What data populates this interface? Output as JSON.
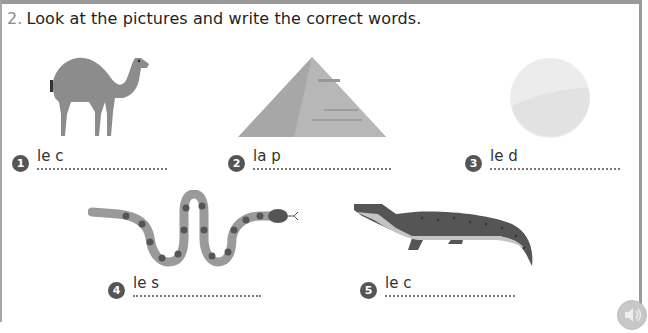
{
  "exercise": {
    "number": "2.",
    "instruction": "Look at the pictures and write the correct words."
  },
  "items": [
    {
      "index": "1",
      "prefix": "le c",
      "picture": "camel"
    },
    {
      "index": "2",
      "prefix": "la p",
      "picture": "pyramid"
    },
    {
      "index": "3",
      "prefix": "le d",
      "picture": "desert-sun"
    },
    {
      "index": "4",
      "prefix": "le s",
      "picture": "snake"
    },
    {
      "index": "5",
      "prefix": "le c",
      "picture": "crocodile"
    }
  ],
  "audio": {
    "icon": "speaker-icon"
  },
  "colors": {
    "border": "#9a9a9a",
    "badge": "#555555",
    "text": "#222222"
  }
}
